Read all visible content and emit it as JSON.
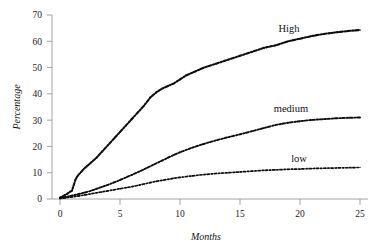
{
  "chart_data": {
    "type": "line",
    "title": "",
    "xlabel": "Months",
    "ylabel": "Percentage",
    "xlim": [
      0,
      25
    ],
    "ylim": [
      0,
      70
    ],
    "xticks": [
      0,
      5,
      10,
      15,
      20,
      25
    ],
    "yticks": [
      0,
      10,
      20,
      30,
      40,
      50,
      60,
      70
    ],
    "grid": false,
    "legend_position": "inline-right-of-curve",
    "annotations": [
      "High",
      "medium",
      "low"
    ],
    "marker_style": "dotted-dashed trace",
    "series": [
      {
        "name": "High",
        "label": "High",
        "x": [
          0,
          0.3,
          0.6,
          1.0,
          1.3,
          1.5,
          2.0,
          2.5,
          3.0,
          3.5,
          4.0,
          4.5,
          5.0,
          5.5,
          6.0,
          6.5,
          7.0,
          7.5,
          8.0,
          8.5,
          9.0,
          9.5,
          10.0,
          10.5,
          11.0,
          12.0,
          13.0,
          14.0,
          15.0,
          16.0,
          17.0,
          18.0,
          19.0,
          20.0,
          21.0,
          22.0,
          23.0,
          24.0,
          25.0
        ],
        "values": [
          0.5,
          1.2,
          2.0,
          3.2,
          7.5,
          9.0,
          11.5,
          13.5,
          15.5,
          18.0,
          20.5,
          23.0,
          25.5,
          28.0,
          30.5,
          33.0,
          35.5,
          38.5,
          40.5,
          42.0,
          43.0,
          44.0,
          45.5,
          47.0,
          48.0,
          50.0,
          51.5,
          53.0,
          54.5,
          56.0,
          57.5,
          58.5,
          60.0,
          61.0,
          62.0,
          62.8,
          63.4,
          63.9,
          64.3
        ]
      },
      {
        "name": "medium",
        "label": "medium",
        "x": [
          0,
          0.5,
          1.0,
          1.5,
          2.0,
          2.5,
          3.0,
          3.5,
          4.0,
          4.5,
          5.0,
          5.5,
          6.0,
          6.5,
          7.0,
          7.5,
          8.0,
          8.5,
          9.0,
          9.5,
          10.0,
          11.0,
          12.0,
          13.0,
          14.0,
          15.0,
          16.0,
          17.0,
          18.0,
          19.0,
          20.0,
          21.0,
          22.0,
          23.0,
          24.0,
          25.0
        ],
        "values": [
          0.3,
          0.8,
          1.3,
          1.8,
          2.4,
          3.0,
          3.8,
          4.6,
          5.4,
          6.3,
          7.2,
          8.2,
          9.2,
          10.2,
          11.3,
          12.4,
          13.5,
          14.6,
          15.7,
          16.8,
          17.8,
          19.5,
          21.0,
          22.3,
          23.5,
          24.6,
          25.8,
          27.0,
          28.2,
          29.0,
          29.6,
          30.1,
          30.4,
          30.7,
          30.9,
          31.0
        ]
      },
      {
        "name": "low",
        "label": "low",
        "x": [
          0,
          0.5,
          1.0,
          1.5,
          2.0,
          2.5,
          3.0,
          3.5,
          4.0,
          4.5,
          5.0,
          5.5,
          6.0,
          6.5,
          7.0,
          7.5,
          8.0,
          8.5,
          9.0,
          9.5,
          10.0,
          11.0,
          12.0,
          13.0,
          14.0,
          15.0,
          16.0,
          17.0,
          18.0,
          19.0,
          20.0,
          21.0,
          22.0,
          23.0,
          24.0,
          25.0
        ],
        "values": [
          0.2,
          0.5,
          0.8,
          1.1,
          1.5,
          1.9,
          2.3,
          2.7,
          3.1,
          3.5,
          3.9,
          4.3,
          4.7,
          5.2,
          5.7,
          6.2,
          6.7,
          7.1,
          7.5,
          7.9,
          8.2,
          8.8,
          9.3,
          9.7,
          10.0,
          10.3,
          10.6,
          10.9,
          11.1,
          11.3,
          11.4,
          11.6,
          11.7,
          11.8,
          11.9,
          12.0
        ]
      }
    ]
  },
  "labels": {
    "y_axis_title": "Percentage",
    "x_axis_title": "Months",
    "series_high": "High",
    "series_medium": "medium",
    "series_low": "low"
  },
  "ticks": {
    "y": [
      "0",
      "10",
      "20",
      "30",
      "40",
      "50",
      "60",
      "70"
    ],
    "x": [
      "0",
      "5",
      "10",
      "15",
      "20",
      "25"
    ]
  },
  "colors": {
    "background": "#ffffff",
    "axis": "#9a9a9a",
    "data": "#0d0d0d",
    "smooth": "#bdbdbd",
    "text": "#111111"
  }
}
